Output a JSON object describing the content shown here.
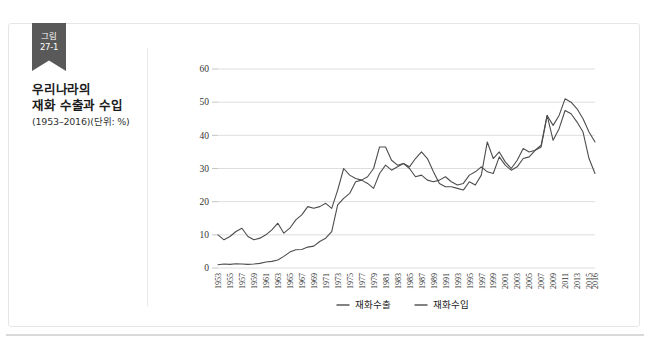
{
  "figure": {
    "ribbon_line1": "그림",
    "ribbon_line2": "27-1",
    "title": "우리나라의\n재화 수출과 수입",
    "title_line1": "우리나라의",
    "title_line2": "재화 수출과 수입",
    "subtitle": "(1953–2016)(단위: %)"
  },
  "colors": {
    "ribbon_bg": "#595959",
    "ribbon_fold": "#8d8d8d",
    "line": "#4d4d4d",
    "gridline": "#d6d6d6",
    "box_border": "#e6e6e6",
    "divider": "#e8e8e8"
  },
  "chart_data": {
    "type": "line",
    "title": "우리나라의 재화 수출과 수입",
    "subtitle": "(1953–2016)(단위: %)",
    "xlabel": "",
    "ylabel": "",
    "ylim": [
      0,
      60
    ],
    "yticks": [
      0,
      10,
      20,
      30,
      40,
      50,
      60
    ],
    "grid": true,
    "legend_position": "bottom",
    "x": [
      1953,
      1954,
      1955,
      1956,
      1957,
      1958,
      1959,
      1960,
      1961,
      1962,
      1963,
      1964,
      1965,
      1966,
      1967,
      1968,
      1969,
      1970,
      1971,
      1972,
      1973,
      1974,
      1975,
      1976,
      1977,
      1978,
      1979,
      1980,
      1981,
      1982,
      1983,
      1984,
      1985,
      1986,
      1987,
      1988,
      1989,
      1990,
      1991,
      1992,
      1993,
      1994,
      1995,
      1996,
      1997,
      1998,
      1999,
      2000,
      2001,
      2002,
      2003,
      2004,
      2005,
      2006,
      2007,
      2008,
      2009,
      2010,
      2011,
      2012,
      2013,
      2014,
      2015,
      2016
    ],
    "xticks": [
      1953,
      1955,
      1957,
      1959,
      1961,
      1963,
      1965,
      1967,
      1969,
      1971,
      1973,
      1975,
      1977,
      1979,
      1981,
      1983,
      1985,
      1987,
      1989,
      1991,
      1993,
      1995,
      1997,
      1999,
      2001,
      2003,
      2005,
      2007,
      2009,
      2011,
      2013,
      2015,
      2016
    ],
    "xtick_labels": [
      "1953",
      "1955",
      "1957",
      "1959",
      "1961",
      "1963",
      "1965",
      "1967",
      "1969",
      "1971",
      "1973",
      "1975",
      "1977",
      "1979",
      "1981",
      "1983",
      "1985",
      "1987",
      "1989",
      "1991",
      "1993",
      "1995",
      "1997",
      "1999",
      "2001",
      "2003",
      "2005",
      "2007",
      "2009",
      "2011",
      "2013",
      "2015",
      "2016"
    ],
    "series": [
      {
        "name": "재화수출",
        "values": [
          1.0,
          1.2,
          1.1,
          1.3,
          1.2,
          1.1,
          1.2,
          1.4,
          1.8,
          2.0,
          2.4,
          3.5,
          4.8,
          5.5,
          5.6,
          6.3,
          6.6,
          8.0,
          9.0,
          11.0,
          19.0,
          21.0,
          22.5,
          26.0,
          26.5,
          25.5,
          24.0,
          28.5,
          31.0,
          29.5,
          30.5,
          31.5,
          30.5,
          33.0,
          35.0,
          33.0,
          29.0,
          25.5,
          24.5,
          24.5,
          24.0,
          23.5,
          26.0,
          25.0,
          28.0,
          38.0,
          33.0,
          35.0,
          32.0,
          30.0,
          32.5,
          36.0,
          35.0,
          35.5,
          37.0,
          46.0,
          43.0,
          46.0,
          51.0,
          50.0,
          48.0,
          45.0,
          41.0,
          38.0
        ],
        "color": "#4d4d4d"
      },
      {
        "name": "재화수입",
        "values": [
          10.0,
          8.5,
          9.5,
          11.0,
          12.0,
          9.5,
          8.5,
          9.0,
          10.0,
          11.5,
          13.5,
          10.5,
          12.0,
          14.5,
          16.0,
          18.5,
          18.0,
          18.5,
          19.5,
          18.0,
          23.5,
          30.0,
          28.0,
          27.0,
          26.5,
          27.5,
          30.0,
          36.5,
          36.5,
          32.5,
          31.0,
          31.5,
          30.0,
          27.5,
          28.0,
          26.5,
          26.0,
          26.5,
          27.5,
          26.0,
          25.0,
          25.5,
          28.0,
          29.0,
          30.5,
          29.0,
          28.5,
          33.5,
          31.0,
          29.5,
          30.5,
          33.0,
          33.5,
          35.5,
          36.5,
          46.0,
          38.5,
          42.0,
          47.5,
          46.5,
          44.0,
          41.0,
          33.0,
          28.5
        ],
        "color": "#4d4d4d"
      }
    ],
    "legend": [
      "재화수출",
      "재화수입"
    ]
  }
}
